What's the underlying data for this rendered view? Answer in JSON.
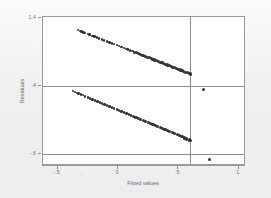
{
  "chart_data": {
    "type": "scatter",
    "title": "",
    "xlabel": "Fitted values",
    "ylabel": "Residuals",
    "xlim": [
      -0.62,
      1.06
    ],
    "ylim": [
      -0.78,
      1.42
    ],
    "xticks": [
      -0.5,
      0,
      0.5,
      1
    ],
    "xticklabels": [
      "-.5",
      "0",
      ".5",
      "1"
    ],
    "yticks": [
      1.4,
      0.4,
      -0.6
    ],
    "yticklabels": [
      "1.4",
      ".4",
      "-.6"
    ],
    "grid": false,
    "legend": null,
    "marker_color": "#333333",
    "reference_lines": {
      "horizontal": [
        0.4,
        -0.6
      ],
      "vertical": [
        0.6
      ],
      "color": "#8f8f8f"
    },
    "series": [
      {
        "name": "upper-band",
        "comment": "sparse dashed markers at left becoming a dense solid band at right",
        "x": [
          -0.33,
          -0.315,
          -0.3,
          -0.285,
          -0.27,
          -0.25,
          -0.235,
          -0.21,
          -0.195,
          -0.175,
          -0.155,
          -0.13,
          -0.115,
          -0.09,
          -0.07,
          -0.05,
          -0.03,
          -0.01,
          0.01,
          0.03,
          0.05,
          0.07,
          0.085,
          0.1,
          0.12,
          0.14,
          0.155,
          0.17,
          0.185,
          0.2,
          0.215,
          0.23,
          0.245,
          0.26,
          0.275,
          0.29,
          0.305,
          0.32,
          0.335,
          0.35,
          0.365,
          0.38,
          0.395,
          0.41,
          0.425,
          0.44,
          0.455,
          0.47,
          0.485,
          0.5,
          0.515,
          0.53,
          0.545,
          0.56,
          0.575,
          0.59,
          0.6
        ],
        "y": [
          1.225,
          1.215,
          1.205,
          1.194,
          1.184,
          1.17,
          1.16,
          1.142,
          1.132,
          1.118,
          1.104,
          1.087,
          1.076,
          1.059,
          1.045,
          1.031,
          1.017,
          1.004,
          0.99,
          0.976,
          0.962,
          0.948,
          0.938,
          0.928,
          0.914,
          0.9,
          0.89,
          0.879,
          0.869,
          0.858,
          0.848,
          0.837,
          0.827,
          0.816,
          0.806,
          0.795,
          0.785,
          0.774,
          0.764,
          0.753,
          0.743,
          0.732,
          0.722,
          0.711,
          0.701,
          0.69,
          0.68,
          0.669,
          0.659,
          0.648,
          0.638,
          0.627,
          0.617,
          0.606,
          0.596,
          0.585,
          0.578
        ]
      },
      {
        "name": "lower-band",
        "comment": "sparse dashed markers at left becoming a dense solid band at right",
        "x": [
          -0.37,
          -0.355,
          -0.34,
          -0.325,
          -0.305,
          -0.29,
          -0.27,
          -0.25,
          -0.23,
          -0.21,
          -0.19,
          -0.17,
          -0.15,
          -0.13,
          -0.11,
          -0.09,
          -0.07,
          -0.05,
          -0.03,
          -0.01,
          0.01,
          0.03,
          0.05,
          0.07,
          0.09,
          0.11,
          0.13,
          0.15,
          0.17,
          0.19,
          0.21,
          0.23,
          0.25,
          0.27,
          0.29,
          0.31,
          0.33,
          0.35,
          0.37,
          0.39,
          0.41,
          0.43,
          0.45,
          0.47,
          0.49,
          0.51,
          0.53,
          0.55,
          0.57,
          0.59,
          0.6
        ],
        "y": [
          0.325,
          0.313,
          0.302,
          0.29,
          0.275,
          0.264,
          0.249,
          0.234,
          0.219,
          0.204,
          0.189,
          0.174,
          0.159,
          0.144,
          0.129,
          0.114,
          0.099,
          0.084,
          0.069,
          0.054,
          0.039,
          0.024,
          0.009,
          -0.006,
          -0.021,
          -0.036,
          -0.051,
          -0.066,
          -0.081,
          -0.096,
          -0.111,
          -0.126,
          -0.141,
          -0.156,
          -0.171,
          -0.186,
          -0.201,
          -0.216,
          -0.231,
          -0.246,
          -0.261,
          -0.276,
          -0.291,
          -0.306,
          -0.321,
          -0.336,
          -0.351,
          -0.366,
          -0.381,
          -0.396,
          -0.404
        ]
      },
      {
        "name": "outliers",
        "comment": "isolated points to the right of the vertical reference line",
        "x": [
          0.71,
          0.76
        ],
        "y": [
          0.355,
          -0.685
        ]
      }
    ]
  }
}
